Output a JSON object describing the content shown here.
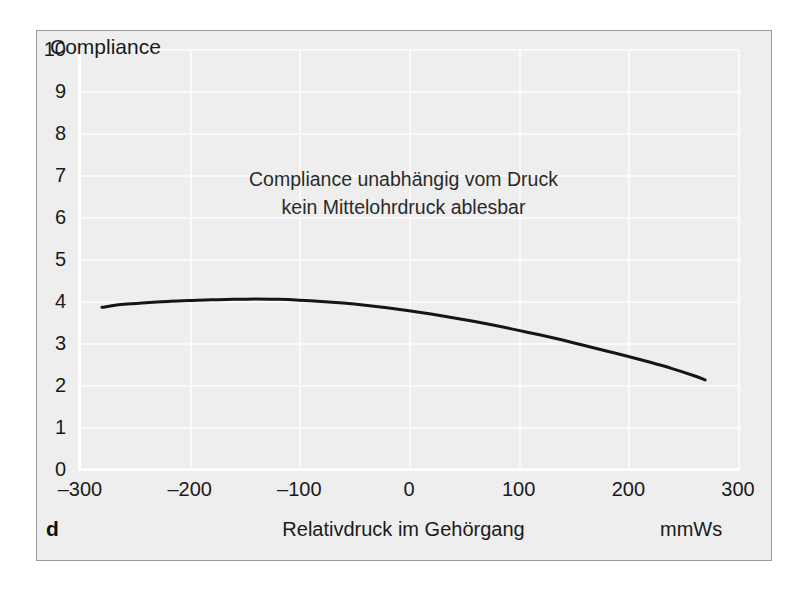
{
  "figure": {
    "panel_letter": "d",
    "background_color": "#eeeeee",
    "border_color": "#9a9a9a",
    "curve_color": "#151515",
    "gridline_color": "#fafafa",
    "text_color": "#1a1a1a"
  },
  "chart_data": {
    "type": "line",
    "title": "Compliance",
    "xlabel": "Relativdruck im Gehörgang",
    "ylabel": "Compliance",
    "xunit": "mmWs",
    "xlim": [
      -300,
      300
    ],
    "ylim": [
      0,
      10
    ],
    "grid": true,
    "legend": "none",
    "xticks": [
      -300,
      -200,
      -100,
      0,
      100,
      200,
      300
    ],
    "xticklabels": [
      "–300",
      "–200",
      "–100",
      "0",
      "100",
      "200",
      "300"
    ],
    "yticks": [
      0,
      1,
      2,
      3,
      4,
      5,
      6,
      7,
      8,
      9,
      10
    ],
    "yticklabels": [
      "0",
      "1",
      "2",
      "3",
      "4",
      "5",
      "6",
      "7",
      "8",
      "9",
      "10"
    ],
    "series": [
      {
        "name": "Tympanogramm Typ B (flach)",
        "x": [
          -280,
          -260,
          -240,
          -220,
          -200,
          -180,
          -160,
          -140,
          -120,
          -100,
          -80,
          -60,
          -40,
          -20,
          0,
          20,
          40,
          60,
          80,
          100,
          120,
          140,
          160,
          180,
          200,
          220,
          240,
          260,
          270
        ],
        "y": [
          3.85,
          3.92,
          3.96,
          3.99,
          4.01,
          4.03,
          4.04,
          4.05,
          4.04,
          4.02,
          3.99,
          3.95,
          3.9,
          3.84,
          3.77,
          3.69,
          3.6,
          3.51,
          3.41,
          3.3,
          3.19,
          3.07,
          2.94,
          2.81,
          2.68,
          2.54,
          2.39,
          2.22,
          2.12
        ]
      }
    ],
    "annotations": [
      "Compliance unabhängig vom Druck",
      "kein Mittelohrdruck ablesbar"
    ]
  }
}
